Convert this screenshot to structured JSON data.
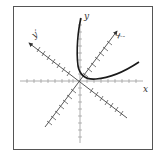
{
  "diagram": {
    "type": "rotated-axes-conic",
    "labels": {
      "x": "x",
      "y": "y",
      "x_prime": "x′",
      "y_prime": "y′"
    },
    "colors": {
      "axis": "#9a9a9a",
      "rotated_axis": "#555555",
      "curve": "#1a1a1a",
      "frame": "#555555"
    },
    "rotation_angle_deg": 45,
    "curve_description": "one branch of a conic opening toward the upper-right in the rotated x′y′ frame"
  }
}
